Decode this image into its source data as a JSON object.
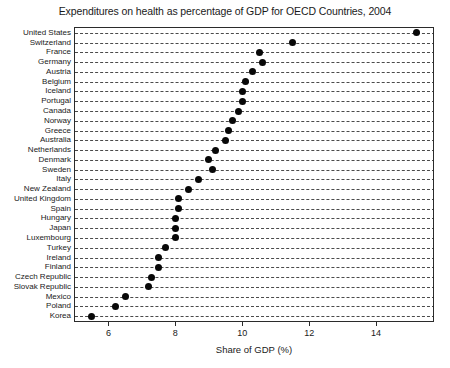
{
  "chart_data": {
    "type": "scatter",
    "title": "Expenditures on health as percentage of GDP for OECD Countries, 2004",
    "xlabel": "Share of GDP (%)",
    "ylabel": "",
    "xlim": [
      5.0,
      15.7
    ],
    "xticks": [
      6,
      8,
      10,
      12,
      14
    ],
    "xticklabels": [
      "6",
      "8",
      "10",
      "12",
      "14"
    ],
    "grid": "horizontal-dashed",
    "legend": "none",
    "orientation": "dotplot-horizontal",
    "sorted": "descending",
    "categories": [
      "United States",
      "Switzerland",
      "France",
      "Germany",
      "Austria",
      "Belgium",
      "Iceland",
      "Portugal",
      "Canada",
      "Norway",
      "Greece",
      "Australia",
      "Netherlands",
      "Denmark",
      "Sweden",
      "Italy",
      "New Zealand",
      "United Kingdom",
      "Spain",
      "Hungary",
      "Japan",
      "Luxembourg",
      "Turkey",
      "Ireland",
      "Finland",
      "Czech Republic",
      "Slovak Republic",
      "Mexico",
      "Poland",
      "Korea"
    ],
    "values": [
      15.2,
      11.5,
      10.5,
      10.6,
      10.3,
      10.1,
      10.0,
      10.0,
      9.9,
      9.7,
      9.6,
      9.5,
      9.2,
      9.0,
      9.1,
      8.7,
      8.4,
      8.1,
      8.1,
      8.0,
      8.0,
      8.0,
      7.7,
      7.5,
      7.5,
      7.3,
      7.2,
      6.5,
      6.2,
      5.5
    ]
  }
}
